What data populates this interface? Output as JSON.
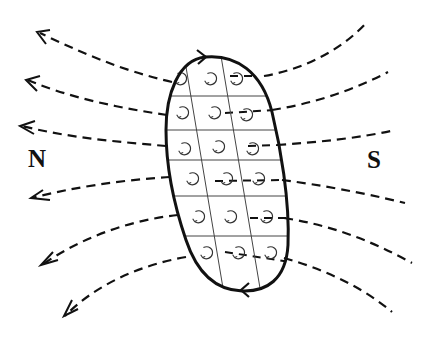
{
  "diagram": {
    "labels": {
      "north": "N",
      "south": "S"
    },
    "colors": {
      "line": "#111111",
      "grid": "#444444",
      "background": "#ffffff"
    },
    "body": {
      "shape": "elongated-oval",
      "grid_rows": 6,
      "grid_cols": 3,
      "cell_symbol": "circular-current-arrow",
      "boundary_arrows": [
        "top-clockwise",
        "bottom-leftward"
      ]
    },
    "field_lines": {
      "count_left": 6,
      "count_right": 6,
      "style": "dashed",
      "arrow_direction": "toward-N"
    }
  }
}
